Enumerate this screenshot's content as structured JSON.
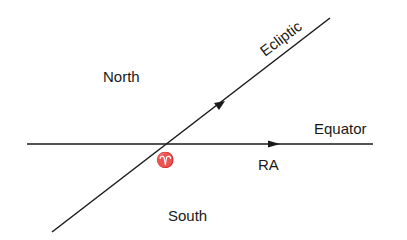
{
  "diagram": {
    "labels": {
      "north": "North",
      "south": "South",
      "ecliptic": "Ecliptic",
      "equator": "Equator",
      "ra": "RA",
      "vernal_equinox_symbol": "♈"
    },
    "colors": {
      "line": "#1a1a1a",
      "background": "#ffffff"
    }
  }
}
